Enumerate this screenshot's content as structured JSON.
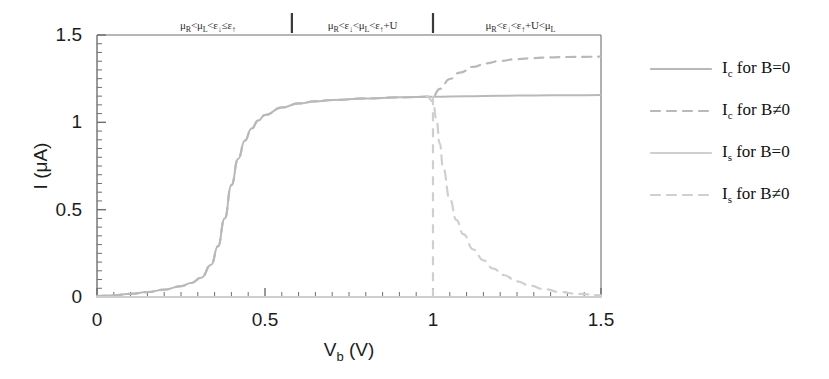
{
  "figure": {
    "background": "#ffffff",
    "axis_color": "#6f6f6f",
    "text_color": "#1d1d1d"
  },
  "axes": {
    "x": {
      "label": "V",
      "label_sub": "b",
      "label_unit": "(V)",
      "label_full": "V_b (V)",
      "min": 0,
      "max": 1.5,
      "ticks": [
        0,
        0.5,
        1,
        1.5
      ],
      "tick_labels": [
        "0",
        "0.5",
        "1",
        "1.5"
      ],
      "minor_tick_step": 0.05
    },
    "y": {
      "label_full": "I (μA)",
      "min": 0,
      "max": 1.5,
      "ticks": [
        0,
        0.5,
        1,
        1.5
      ],
      "tick_labels": [
        "0",
        "0.5",
        "1",
        "1.5"
      ],
      "minor_tick_step": 0.05
    },
    "grid": false
  },
  "region_annotations": {
    "separators": [
      0.58,
      1.0
    ],
    "labels": [
      {
        "x": 0.33,
        "text": "μR<μL<ε↓≤ε↑",
        "parts": [
          "μ",
          "R",
          "<",
          "μ",
          "L",
          "<",
          "ε",
          "↓",
          "≤",
          "ε",
          "↑"
        ]
      },
      {
        "x": 0.79,
        "text": "μR<ε↓<μL<ε↑+U",
        "parts": [
          "μ",
          "R",
          "<",
          "ε",
          "↓",
          "<",
          "μ",
          "L",
          "<",
          "ε",
          "↑",
          "+U"
        ]
      },
      {
        "x": 1.26,
        "text": "μR<ε↓<ε↑+U<μL",
        "parts": [
          "μ",
          "R",
          "<",
          "ε",
          "↓",
          "<",
          "ε",
          "↑",
          "+U<",
          "μ",
          "L"
        ]
      }
    ]
  },
  "legend": {
    "position": "right",
    "entries": [
      {
        "label": "I",
        "sub": "c",
        "rest": " for B=0",
        "full": "I_c for B=0",
        "style": "solid",
        "color": "#b9b9b9"
      },
      {
        "label": "I",
        "sub": "c",
        "rest": " for B≠0",
        "full": "I_c for B≠0",
        "style": "dashed",
        "color": "#b9b9b9"
      },
      {
        "label": "I",
        "sub": "s",
        "rest": " for B=0",
        "full": "I_s for B=0",
        "style": "solid",
        "color": "#cfcfcf"
      },
      {
        "label": "I",
        "sub": "s",
        "rest": " for B≠0",
        "full": "I_s for B≠0",
        "style": "dashed",
        "color": "#cfcfcf"
      }
    ]
  },
  "chart_data": {
    "type": "line",
    "title": "",
    "xlabel": "V_b (V)",
    "ylabel": "I (μA)",
    "xlim": [
      0,
      1.5
    ],
    "ylim": [
      0,
      1.5
    ],
    "grid": false,
    "legend_position": "right",
    "annotations": [
      "μR<μL<ε↓≤ε↑",
      "μR<ε↓<μL<ε↑+U",
      "μR<ε↓<ε↑+U<μL"
    ],
    "series": [
      {
        "name": "I_c for B=0",
        "style": "solid",
        "color": "#b9b9b9",
        "x": [
          0.0,
          0.05,
          0.1,
          0.15,
          0.2,
          0.25,
          0.28,
          0.31,
          0.34,
          0.36,
          0.38,
          0.4,
          0.42,
          0.44,
          0.46,
          0.48,
          0.5,
          0.55,
          0.6,
          0.65,
          0.7,
          0.8,
          0.9,
          1.0,
          1.1,
          1.2,
          1.3,
          1.4,
          1.5
        ],
        "y": [
          0.005,
          0.01,
          0.018,
          0.028,
          0.042,
          0.062,
          0.08,
          0.11,
          0.185,
          0.29,
          0.45,
          0.64,
          0.79,
          0.895,
          0.965,
          1.01,
          1.042,
          1.085,
          1.108,
          1.12,
          1.128,
          1.137,
          1.143,
          1.147,
          1.15,
          1.152,
          1.154,
          1.155,
          1.156
        ]
      },
      {
        "name": "I_c for B≠0",
        "style": "dashed",
        "color": "#b9b9b9",
        "x": [
          0.0,
          0.05,
          0.1,
          0.15,
          0.2,
          0.25,
          0.28,
          0.31,
          0.34,
          0.36,
          0.38,
          0.4,
          0.42,
          0.44,
          0.46,
          0.48,
          0.5,
          0.55,
          0.6,
          0.65,
          0.7,
          0.8,
          0.9,
          0.98,
          1.0,
          1.02,
          1.05,
          1.08,
          1.12,
          1.16,
          1.2,
          1.25,
          1.3,
          1.35,
          1.4,
          1.45,
          1.5
        ],
        "y": [
          0.005,
          0.01,
          0.018,
          0.028,
          0.042,
          0.062,
          0.08,
          0.11,
          0.185,
          0.29,
          0.45,
          0.64,
          0.79,
          0.895,
          0.965,
          1.01,
          1.042,
          1.085,
          1.108,
          1.12,
          1.128,
          1.137,
          1.143,
          1.147,
          1.15,
          1.192,
          1.248,
          1.285,
          1.318,
          1.338,
          1.352,
          1.362,
          1.368,
          1.372,
          1.374,
          1.375,
          1.376
        ]
      },
      {
        "name": "I_s for B=0",
        "style": "solid",
        "color": "#cfcfcf",
        "x": [
          0.0,
          0.25,
          0.5,
          0.75,
          1.0,
          1.25,
          1.5
        ],
        "y": [
          0.0,
          0.0,
          0.0,
          0.0,
          0.0,
          0.0,
          0.0
        ]
      },
      {
        "name": "I_s for B≠0",
        "style": "dashed",
        "color": "#cfcfcf",
        "x": [
          0.98,
          1.0,
          1.01,
          1.02,
          1.03,
          1.05,
          1.07,
          1.09,
          1.12,
          1.15,
          1.18,
          1.21,
          1.25,
          1.29,
          1.33,
          1.38,
          1.43,
          1.5
        ],
        "y": [
          1.15,
          1.12,
          1.02,
          0.88,
          0.74,
          0.56,
          0.44,
          0.36,
          0.272,
          0.21,
          0.162,
          0.126,
          0.09,
          0.064,
          0.045,
          0.028,
          0.018,
          0.01
        ]
      }
    ]
  }
}
